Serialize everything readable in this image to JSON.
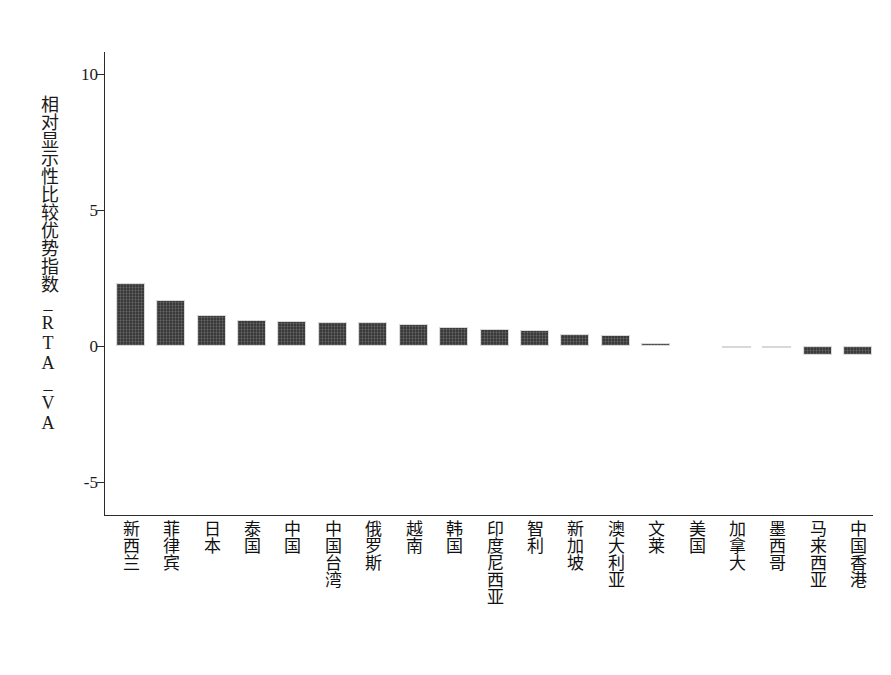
{
  "chart_data": {
    "type": "bar",
    "title": "",
    "xlabel": "",
    "ylabel": "相对显示性比较优势指数_RTA_VA",
    "ylim": [
      -6.2,
      10.8
    ],
    "yticks": [
      10,
      5,
      0,
      -5
    ],
    "ytick_labels": [
      "10",
      "5",
      "0",
      "-5"
    ],
    "grid": false,
    "legend": "none",
    "bar_color": "#3a3a3a",
    "categories": [
      "新西兰",
      "菲律宾",
      "日本",
      "泰国",
      "中国",
      "中国台湾",
      "俄罗斯",
      "越南",
      "韩国",
      "印度尼西亚",
      "智利",
      "新加坡",
      "澳大利亚",
      "文莱",
      "美国",
      "加拿大",
      "墨西哥",
      "马来西亚",
      "中国香港"
    ],
    "values": [
      2.33,
      1.7,
      1.13,
      0.95,
      0.93,
      0.9,
      0.87,
      0.8,
      0.7,
      0.63,
      0.6,
      0.46,
      0.42,
      0.11,
      0.0,
      -0.06,
      -0.07,
      -0.33,
      -0.31
    ]
  }
}
